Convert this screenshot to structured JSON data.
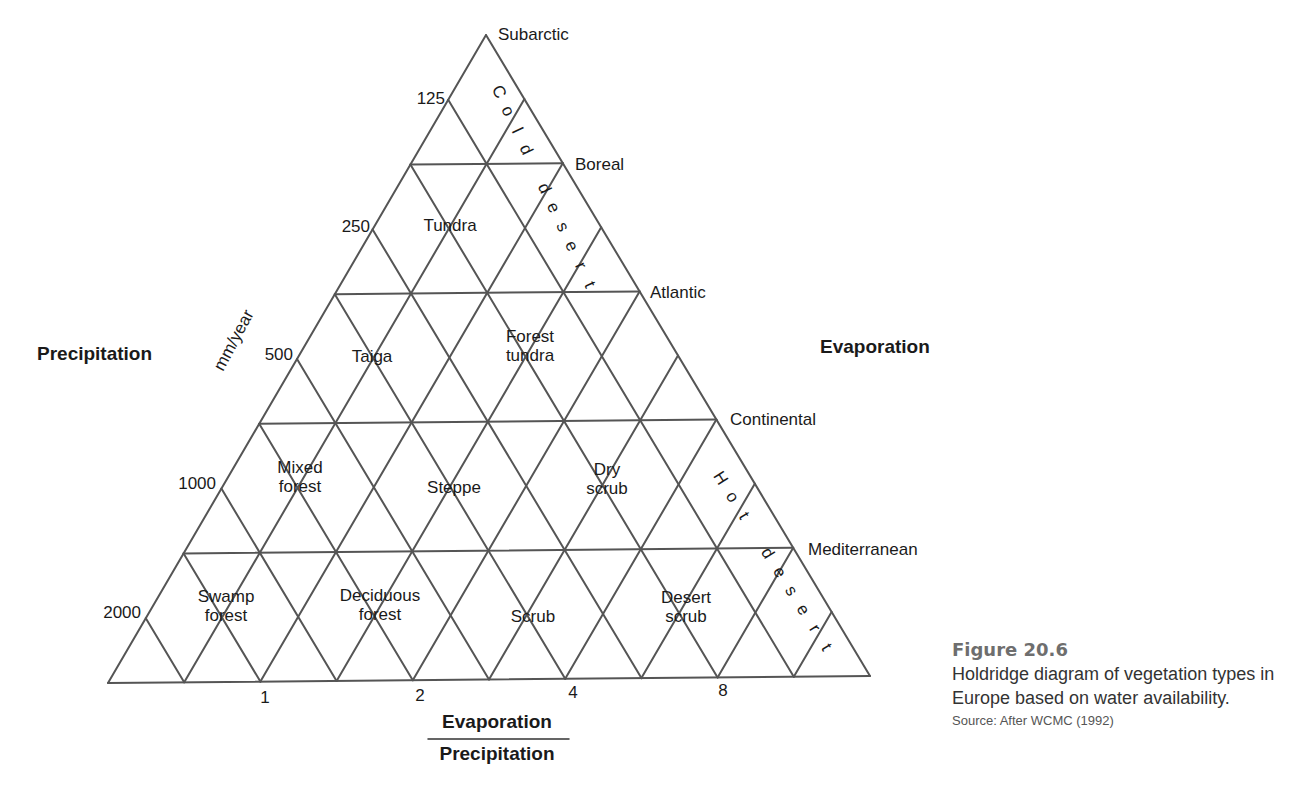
{
  "figure": {
    "number": "Figure 20.6",
    "caption": "Holdridge diagram of vegetation types in Europe based on water availability.",
    "source": "Source: After WCMC (1992)"
  },
  "axes": {
    "left_title": "Precipitation",
    "left_unit": "mm/year",
    "right_title": "Evaporation",
    "bottom_numerator": "Evaporation",
    "bottom_denominator": "Precipitation",
    "precipitation_ticks": [
      {
        "label": "125",
        "x": 445,
        "y": 104
      },
      {
        "label": "250",
        "x": 370,
        "y": 232
      },
      {
        "label": "500",
        "x": 293,
        "y": 360
      },
      {
        "label": "1000",
        "x": 216,
        "y": 489
      },
      {
        "label": "2000",
        "x": 141,
        "y": 618
      }
    ],
    "ratio_ticks": [
      {
        "label": "1",
        "x": 265,
        "y": 703
      },
      {
        "label": "2",
        "x": 420,
        "y": 701
      },
      {
        "label": "4",
        "x": 573,
        "y": 698
      },
      {
        "label": "8",
        "x": 723,
        "y": 696
      }
    ]
  },
  "right_edge_labels": [
    {
      "label": "Subarctic",
      "x": 498,
      "y": 40
    },
    {
      "label": "Boreal",
      "x": 575,
      "y": 170
    },
    {
      "label": "Atlantic",
      "x": 650,
      "y": 298
    },
    {
      "label": "Continental",
      "x": 730,
      "y": 425
    },
    {
      "label": "Mediterranean",
      "x": 808,
      "y": 555
    }
  ],
  "zones": [
    {
      "name": "Tundra",
      "lines": [
        "Tundra"
      ],
      "x": 450,
      "y": 231
    },
    {
      "name": "Taiga",
      "lines": [
        "Taiga"
      ],
      "x": 372,
      "y": 362
    },
    {
      "name": "Forest tundra",
      "lines": [
        "Forest",
        "tundra"
      ],
      "x": 530,
      "y": 351
    },
    {
      "name": "Mixed forest",
      "lines": [
        "Mixed",
        "forest"
      ],
      "x": 300,
      "y": 482
    },
    {
      "name": "Steppe",
      "lines": [
        "Steppe"
      ],
      "x": 454,
      "y": 493
    },
    {
      "name": "Dry scrub",
      "lines": [
        "Dry",
        "scrub"
      ],
      "x": 607,
      "y": 484
    },
    {
      "name": "Swamp forest",
      "lines": [
        "Swamp",
        "forest"
      ],
      "x": 226,
      "y": 611
    },
    {
      "name": "Deciduous forest",
      "lines": [
        "Deciduous",
        "forest"
      ],
      "x": 380,
      "y": 610
    },
    {
      "name": "Scrub",
      "lines": [
        "Scrub"
      ],
      "x": 533,
      "y": 622
    },
    {
      "name": "Desert scrub",
      "lines": [
        "Desert",
        "scrub"
      ],
      "x": 686,
      "y": 612
    }
  ],
  "desert_bands": [
    {
      "name": "Cold desert",
      "words": [
        "Cold",
        "desert"
      ],
      "x1": 494,
      "y1": 94,
      "x2": 585,
      "y2": 287
    },
    {
      "name": "Hot desert",
      "words": [
        "Hot",
        "desert"
      ],
      "x1": 716,
      "y1": 481,
      "x2": 822,
      "y2": 650
    }
  ],
  "geometry": {
    "apex": [
      486,
      35
    ],
    "bottom_left": [
      108,
      683
    ],
    "bottom_right": [
      870,
      676
    ],
    "divisions": 5,
    "line_color": "#555555"
  }
}
